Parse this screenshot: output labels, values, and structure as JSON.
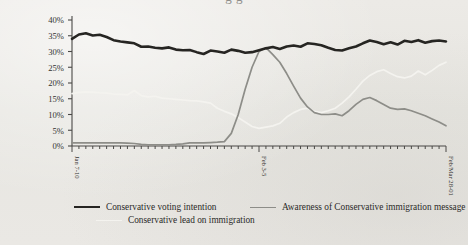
{
  "page": {
    "background_color": "#e9e8e4",
    "cropped_title_fragment": "g                    g"
  },
  "chart_data": {
    "type": "line",
    "title": "",
    "xlabel": "",
    "ylabel": "",
    "ylim": [
      0,
      40
    ],
    "yticks": [
      "0%",
      "5%",
      "10%",
      "15%",
      "20%",
      "25%",
      "30%",
      "35%",
      "40%"
    ],
    "ytick_values": [
      0,
      5,
      10,
      15,
      20,
      25,
      30,
      35,
      40
    ],
    "grid": false,
    "legend_position": "below",
    "x_tick_count": 55,
    "xtick_labels": [
      {
        "index": 0,
        "label": "Jan 7-10"
      },
      {
        "index": 27,
        "label": "Feb 3-5"
      },
      {
        "index": 54,
        "label": "Feb/Mar 28-01"
      }
    ],
    "series": [
      {
        "name": "Conservative voting intention",
        "color": "#262522",
        "width": 2.6,
        "values": [
          34.0,
          35.4,
          35.8,
          35.1,
          35.3,
          34.6,
          33.6,
          33.2,
          32.9,
          32.6,
          31.5,
          31.6,
          31.2,
          31.0,
          31.3,
          30.6,
          30.4,
          30.5,
          29.8,
          29.2,
          30.3,
          30.0,
          29.6,
          30.6,
          30.2,
          29.6,
          29.8,
          30.4,
          31.0,
          31.4,
          30.8,
          31.6,
          31.9,
          31.5,
          32.6,
          32.4,
          32.0,
          31.2,
          30.5,
          30.3,
          31.0,
          31.6,
          32.6,
          33.5,
          33.0,
          32.3,
          32.9,
          32.2,
          33.4,
          33.0,
          33.6,
          32.8,
          33.3,
          33.5,
          33.2
        ]
      },
      {
        "name": "Conservative lead on immigration",
        "color": "#f4f3ef",
        "width": 1.7,
        "values": [
          16.6,
          17.0,
          17.2,
          17.1,
          16.9,
          16.8,
          16.5,
          16.4,
          16.2,
          17.6,
          16.0,
          15.6,
          15.8,
          15.2,
          15.0,
          14.8,
          14.6,
          14.4,
          14.3,
          14.0,
          13.6,
          12.0,
          11.0,
          10.2,
          9.0,
          7.6,
          6.2,
          5.6,
          6.0,
          6.4,
          7.2,
          9.2,
          10.6,
          11.6,
          12.0,
          11.0,
          10.6,
          11.2,
          12.0,
          13.6,
          15.6,
          18.0,
          20.6,
          22.4,
          23.6,
          24.2,
          23.0,
          22.0,
          21.6,
          22.2,
          23.8,
          22.6,
          24.0,
          25.6,
          26.6
        ]
      },
      {
        "name": "Awareness of Conservative immigration message",
        "color": "#8d8d88",
        "width": 1.7,
        "values": [
          1.0,
          1.0,
          1.0,
          1.0,
          1.0,
          1.0,
          1.0,
          1.0,
          0.9,
          0.8,
          0.5,
          0.4,
          0.4,
          0.4,
          0.4,
          0.5,
          0.7,
          1.0,
          1.0,
          1.0,
          1.1,
          1.2,
          1.4,
          4.0,
          10.0,
          18.0,
          25.0,
          30.0,
          31.2,
          29.0,
          26.6,
          23.0,
          19.0,
          15.2,
          12.4,
          10.6,
          10.0,
          10.0,
          10.2,
          9.6,
          11.2,
          13.2,
          14.8,
          15.4,
          14.4,
          13.2,
          12.0,
          11.6,
          11.8,
          11.2,
          10.4,
          9.6,
          8.6,
          7.6,
          6.4
        ]
      }
    ]
  },
  "legend": {
    "items": [
      {
        "label": "Conservative voting intention",
        "swatch": "black-line-swatch"
      },
      {
        "label": "Awareness of Conservative immigration message",
        "swatch": "gray-line-swatch"
      },
      {
        "label": "Conservative lead on immigration",
        "swatch": "white-line-swatch"
      }
    ]
  }
}
